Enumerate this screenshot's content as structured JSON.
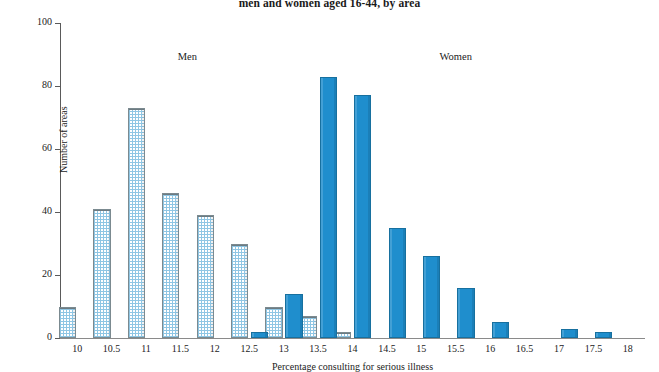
{
  "title": "men and women aged 16-44, by area",
  "annotations": {
    "men": "Men",
    "women": "Women"
  },
  "colors": {
    "women_fill": "#1f8ecd",
    "women_stroke": "#17709f",
    "men_pattern": "#8fc6e4",
    "men_stroke": "#7b8a90",
    "axis": "#5a5a5a",
    "text": "#222222"
  },
  "chart_data": {
    "type": "bar",
    "title": "men and women aged 16-44, by area",
    "xlabel": "Percentage consulting for serious illness",
    "ylabel": "Number of areas",
    "xlim": [
      9.75,
      18.25
    ],
    "ylim": [
      0,
      100
    ],
    "yticks": [
      0,
      20,
      40,
      60,
      80,
      100
    ],
    "xticks": [
      10,
      10.5,
      11,
      11.5,
      12,
      12.5,
      13,
      13.5,
      14,
      14.5,
      15,
      15.5,
      16,
      16.5,
      17,
      17.5,
      18
    ],
    "xtick_labels": [
      "10",
      "10.5",
      "11",
      "11.5",
      "12",
      "12.5",
      "13",
      "13.5",
      "14",
      "14.5",
      "15",
      "15.5",
      "16",
      "16.5",
      "17",
      "17.5",
      "18"
    ],
    "grid": false,
    "legend": "annotated-inline",
    "series": [
      {
        "name": "Men",
        "style": "stippled",
        "x": [
          10.0,
          10.5,
          11.0,
          11.5,
          12.0,
          12.5,
          13.0,
          13.5,
          14.0
        ],
        "values": [
          10,
          41,
          73,
          46,
          39,
          30,
          10,
          7,
          2
        ]
      },
      {
        "name": "Women",
        "style": "solid",
        "x": [
          12.5,
          13.0,
          13.5,
          14.0,
          14.5,
          15.0,
          15.5,
          16.0,
          17.0,
          17.5
        ],
        "values": [
          2,
          14,
          83,
          77,
          35,
          26,
          16,
          5,
          3,
          2
        ]
      }
    ]
  }
}
